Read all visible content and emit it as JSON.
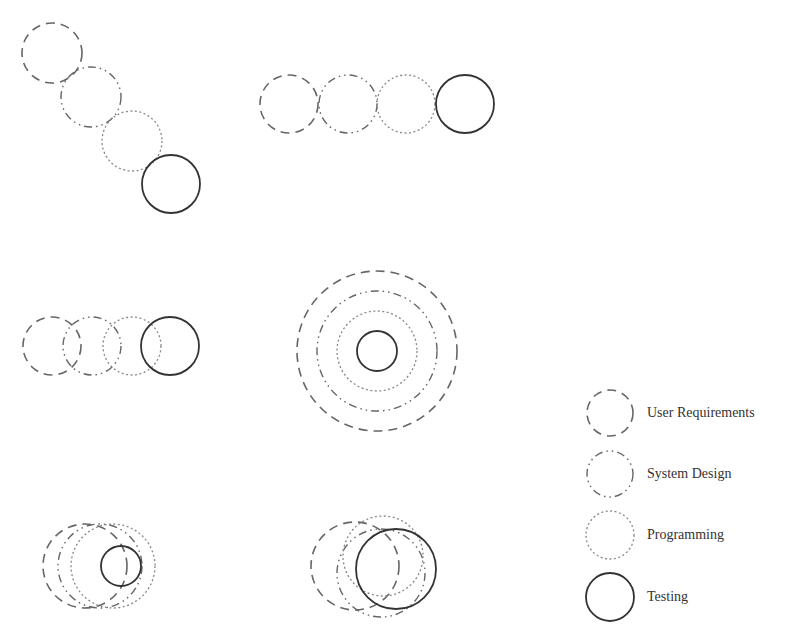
{
  "styles": {
    "user_requirements": {
      "dash": "9 6",
      "color": "#666666",
      "width": 1.6
    },
    "system_design": {
      "dash": "8 4 1.5 4 1.5 4",
      "color": "#666666",
      "width": 1.4
    },
    "programming": {
      "dash": "2 2.5",
      "color": "#888888",
      "width": 1.3
    },
    "testing": {
      "dash": "",
      "color": "#333333",
      "width": 1.8
    }
  },
  "diagrams": [
    {
      "name": "diagonal-sequence",
      "circles": [
        {
          "phase": "user_requirements",
          "cx": 52,
          "cy": 53,
          "r": 30
        },
        {
          "phase": "system_design",
          "cx": 91,
          "cy": 97,
          "r": 30
        },
        {
          "phase": "programming",
          "cx": 132,
          "cy": 141,
          "r": 30
        },
        {
          "phase": "testing",
          "cx": 171,
          "cy": 184,
          "r": 29
        }
      ]
    },
    {
      "name": "horizontal-sequence",
      "circles": [
        {
          "phase": "user_requirements",
          "cx": 289,
          "cy": 104,
          "r": 29
        },
        {
          "phase": "system_design",
          "cx": 348,
          "cy": 104,
          "r": 29
        },
        {
          "phase": "programming",
          "cx": 406,
          "cy": 104,
          "r": 29
        },
        {
          "phase": "testing",
          "cx": 465,
          "cy": 104,
          "r": 29
        }
      ]
    },
    {
      "name": "overlapping-sequence",
      "circles": [
        {
          "phase": "user_requirements",
          "cx": 52,
          "cy": 346,
          "r": 29
        },
        {
          "phase": "system_design",
          "cx": 92,
          "cy": 346,
          "r": 29
        },
        {
          "phase": "programming",
          "cx": 132,
          "cy": 346,
          "r": 29
        },
        {
          "phase": "testing",
          "cx": 170,
          "cy": 346,
          "r": 29
        }
      ]
    },
    {
      "name": "concentric",
      "circles": [
        {
          "phase": "user_requirements",
          "cx": 377,
          "cy": 351,
          "r": 80
        },
        {
          "phase": "system_design",
          "cx": 377,
          "cy": 351,
          "r": 60
        },
        {
          "phase": "programming",
          "cx": 377,
          "cy": 351,
          "r": 40
        },
        {
          "phase": "testing",
          "cx": 377,
          "cy": 351,
          "r": 20
        }
      ]
    },
    {
      "name": "nested-shifted",
      "circles": [
        {
          "phase": "user_requirements",
          "cx": 85,
          "cy": 566,
          "r": 42
        },
        {
          "phase": "system_design",
          "cx": 100,
          "cy": 566,
          "r": 42
        },
        {
          "phase": "programming",
          "cx": 113,
          "cy": 566,
          "r": 42
        },
        {
          "phase": "testing",
          "cx": 121,
          "cy": 566,
          "r": 20
        }
      ]
    },
    {
      "name": "heavily-overlapping",
      "circles": [
        {
          "phase": "user_requirements",
          "cx": 355,
          "cy": 566,
          "r": 44
        },
        {
          "phase": "system_design",
          "cx": 381,
          "cy": 573,
          "r": 44
        },
        {
          "phase": "programming",
          "cx": 383,
          "cy": 556,
          "r": 40
        },
        {
          "phase": "testing",
          "cx": 396,
          "cy": 569,
          "r": 40
        }
      ]
    }
  ],
  "legend": {
    "items": [
      {
        "phase": "user_requirements",
        "label": "User Requirements",
        "cx": 610,
        "cy": 413,
        "r": 23
      },
      {
        "phase": "system_design",
        "label": "System Design",
        "cx": 610,
        "cy": 474,
        "r": 23
      },
      {
        "phase": "programming",
        "label": "Programming",
        "cx": 610,
        "cy": 535,
        "r": 24
      },
      {
        "phase": "testing",
        "label": "Testing",
        "cx": 610,
        "cy": 597,
        "r": 24
      }
    ]
  }
}
